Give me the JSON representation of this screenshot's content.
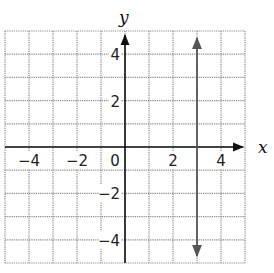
{
  "chart_data": {
    "type": "line",
    "title": "",
    "xlabel": "x",
    "ylabel": "y",
    "xlim": [
      -5,
      5
    ],
    "ylim": [
      -5,
      5
    ],
    "grid": true,
    "grid_style": "dotted",
    "x_ticks": [
      -4,
      -2,
      0,
      2,
      4
    ],
    "y_ticks": [
      4,
      2,
      -2,
      -4
    ],
    "x_tick_labels": [
      "−4",
      "−2",
      "0",
      "2",
      "4"
    ],
    "y_tick_labels": [
      "4",
      "2",
      "−2",
      "−4"
    ],
    "series": [
      {
        "name": "x = 3",
        "type": "vertical-line",
        "x": [
          3,
          3
        ],
        "y": [
          -4.7,
          4.7
        ],
        "arrows": "both",
        "color": "#555555"
      }
    ],
    "legend": null
  },
  "labels": {
    "x_axis": "x",
    "y_axis": "y",
    "origin": "0"
  },
  "colors": {
    "grid": "#8a8a8a",
    "axes": "#111111",
    "line": "#555555"
  }
}
